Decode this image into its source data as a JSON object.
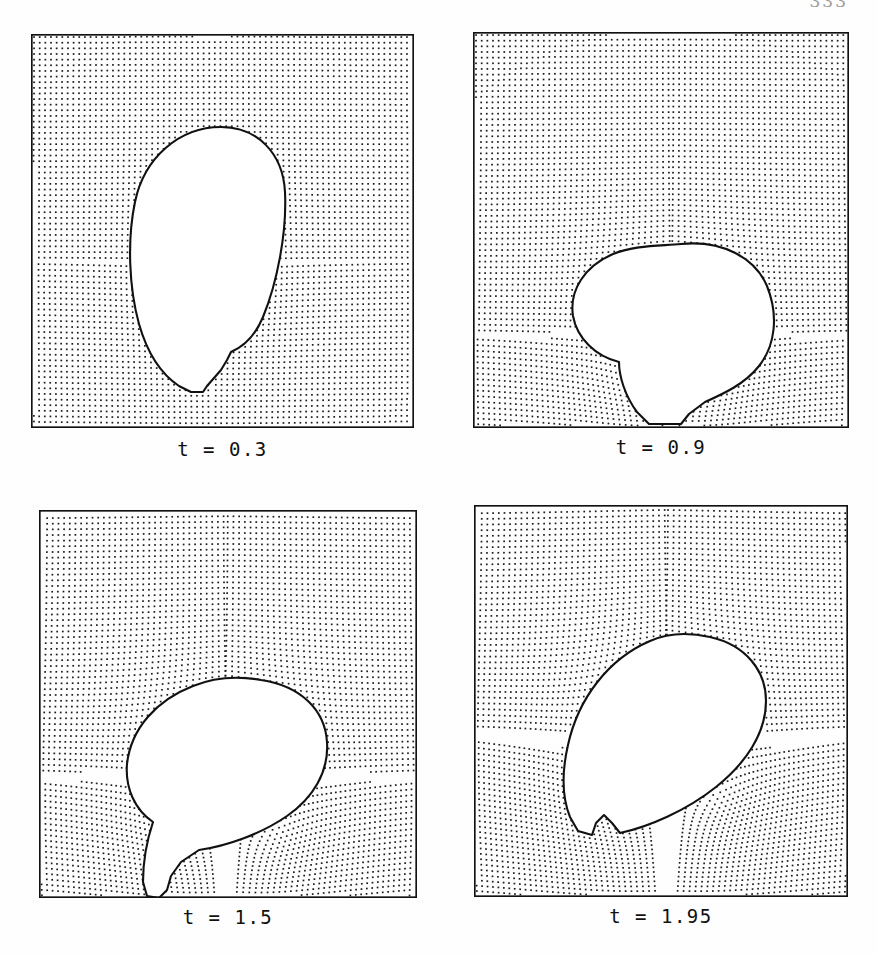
{
  "page": {
    "folio": "333",
    "background_color": "#ffffff",
    "ink_color": "#111111"
  },
  "figure": {
    "kind": "marker-particle-mesh",
    "panel_count": 4,
    "columns": 2,
    "rows": 2
  },
  "chart_data": {
    "type": "scatter",
    "title": "",
    "xlabel": "",
    "ylabel": "",
    "grid": false,
    "legend": null,
    "panels": [
      {
        "id": "panel-t03",
        "label": "t = 0.3",
        "t": 0.3,
        "domain": {
          "x": [
            0,
            1
          ],
          "y": [
            0,
            1
          ]
        },
        "marker_lattice": {
          "nx": 62,
          "ny": 68,
          "spacing_px": 5.6,
          "dot_px": 1.6
        },
        "interface": {
          "closed": true,
          "touches_bottom_wall": true,
          "centroid": [
            0.46,
            0.26
          ],
          "width": 0.41,
          "height": 0.42,
          "tilt_deg": 0,
          "shape": "near-circular, slightly ovoid, resting on the lower wall"
        },
        "mesh_distortion": "weak; lattice essentially uniform except in a thin layer hugging the interface"
      },
      {
        "id": "panel-t09",
        "label": "t = 0.9",
        "t": 0.9,
        "domain": {
          "x": [
            0,
            1
          ],
          "y": [
            0,
            1
          ]
        },
        "marker_lattice": {
          "nx": 62,
          "ny": 68,
          "spacing_px": 5.6,
          "dot_px": 1.6
        },
        "interface": {
          "closed": true,
          "touches_bottom_wall": true,
          "centroid": [
            0.5,
            0.35
          ],
          "width": 0.46,
          "height": 0.56,
          "tilt_deg": -22,
          "shape": "pear / tear-drop, tilted, broad cap with a narrowing neck down to the wall"
        },
        "mesh_distortion": "moderate; particle rows bend around the cap and sweep down the right flank"
      },
      {
        "id": "panel-t15",
        "label": "t = 1.5",
        "t": 1.5,
        "domain": {
          "x": [
            0,
            1
          ],
          "y": [
            0,
            1
          ]
        },
        "marker_lattice": {
          "nx": 62,
          "ny": 68,
          "spacing_px": 5.6,
          "dot_px": 1.6
        },
        "interface": {
          "closed": true,
          "touches_bottom_wall": true,
          "centroid": [
            0.5,
            0.4
          ],
          "width": 0.56,
          "height": 0.55,
          "tilt_deg": -32,
          "shape": "elongated tilted ellipse drawn into a thin tail that still pins to the lower wall"
        },
        "mesh_distortion": "strong; concentric swirl patterns on both flanks, rows fan out from the tail"
      },
      {
        "id": "panel-t195",
        "label": "t = 1.95",
        "t": 1.95,
        "domain": {
          "x": [
            0,
            1
          ],
          "y": [
            0,
            1
          ]
        },
        "marker_lattice": {
          "nx": 62,
          "ny": 68,
          "spacing_px": 5.6,
          "dot_px": 1.6
        },
        "interface": {
          "closed": true,
          "touches_bottom_wall": false,
          "centroid": [
            0.52,
            0.44
          ],
          "width": 0.55,
          "height": 0.52,
          "tilt_deg": -34,
          "shape": "detached tilted ellipsoid with a small re-entrant cusp on the lower-left where pinch-off occurred"
        },
        "mesh_distortion": "very strong; dense concentric bands beneath the bubble marking the collapsing neck"
      }
    ]
  },
  "captions": [
    {
      "label": "t = 0.3"
    },
    {
      "label": "t = 0.9"
    },
    {
      "label": "t = 1.5"
    },
    {
      "label": "t = 1.95"
    }
  ]
}
